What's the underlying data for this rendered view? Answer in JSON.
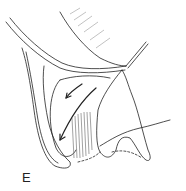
{
  "figure": {
    "panel_label": "E",
    "colors": {
      "ink": "#222222",
      "background": "#ffffff",
      "hatch": "#444444"
    }
  }
}
